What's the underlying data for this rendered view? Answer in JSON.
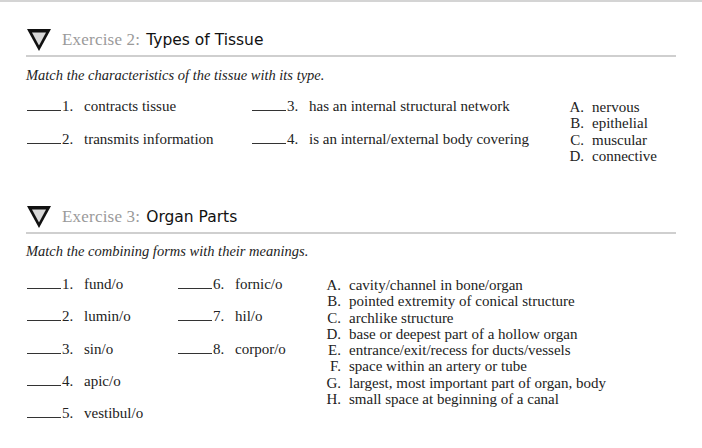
{
  "exercises": [
    {
      "label": "Exercise 2:",
      "title": "Types of Tissue",
      "icon": "down-triangle-icon",
      "instruction": "Match the characteristics of the tissue with its type.",
      "items": [
        {
          "number": "1.",
          "text": "contracts tissue"
        },
        {
          "number": "2.",
          "text": "transmits information"
        },
        {
          "number": "3.",
          "text": "has an internal structural network"
        },
        {
          "number": "4.",
          "text": "is an internal/external body covering"
        }
      ],
      "options": [
        {
          "letter": "A.",
          "text": "nervous"
        },
        {
          "letter": "B.",
          "text": "epithelial"
        },
        {
          "letter": "C.",
          "text": "muscular"
        },
        {
          "letter": "D.",
          "text": "connective"
        }
      ]
    },
    {
      "label": "Exercise 3:",
      "title": "Organ Parts",
      "icon": "down-triangle-icon",
      "instruction": "Match the combining forms with their meanings.",
      "items": [
        {
          "number": "1.",
          "text": "fund/o"
        },
        {
          "number": "2.",
          "text": "lumin/o"
        },
        {
          "number": "3.",
          "text": "sin/o"
        },
        {
          "number": "4.",
          "text": "apic/o"
        },
        {
          "number": "5.",
          "text": "vestibul/o"
        },
        {
          "number": "6.",
          "text": "fornic/o"
        },
        {
          "number": "7.",
          "text": "hil/o"
        },
        {
          "number": "8.",
          "text": "corpor/o"
        }
      ],
      "options": [
        {
          "letter": "A.",
          "text": "cavity/channel in bone/organ"
        },
        {
          "letter": "B.",
          "text": "pointed extremity of conical structure"
        },
        {
          "letter": "C.",
          "text": "archlike structure"
        },
        {
          "letter": "D.",
          "text": "base or deepest part of a hollow organ"
        },
        {
          "letter": "E.",
          "text": "entrance/exit/recess for ducts/vessels"
        },
        {
          "letter": "F.",
          "text": "space within an artery or tube"
        },
        {
          "letter": "G.",
          "text": "largest, most important part of organ, body"
        },
        {
          "letter": "H.",
          "text": "small space at beginning of a canal"
        }
      ]
    }
  ],
  "colors": {
    "label_gray": "#9a9a9a",
    "rule_gray": "#cfcfcf",
    "text": "#222222"
  }
}
